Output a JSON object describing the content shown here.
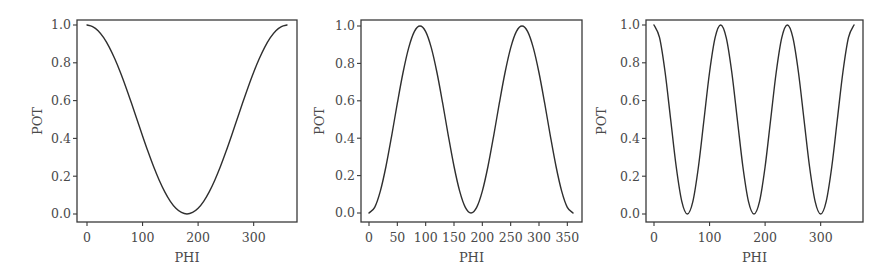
{
  "figure": {
    "panel_count": 3
  },
  "chart_data": [
    {
      "type": "line",
      "title": "",
      "xlabel": "PHI",
      "ylabel": "POT",
      "xlim": [
        0,
        360
      ],
      "ylim": [
        0.0,
        1.0
      ],
      "grid": false,
      "legend": null,
      "xticks": [
        0,
        100,
        200,
        300
      ],
      "xtick_labels": [
        "0",
        "100",
        "200",
        "300"
      ],
      "yticks": [
        0.0,
        0.2,
        0.4,
        0.6,
        0.8,
        1.0
      ],
      "ytick_labels": [
        "0.0",
        "0.2",
        "0.4",
        "0.6",
        "0.8",
        "1.0"
      ],
      "series": [
        {
          "name": "POT",
          "x": [
            0,
            10,
            20,
            30,
            40,
            50,
            60,
            70,
            80,
            90,
            100,
            110,
            120,
            130,
            140,
            150,
            160,
            170,
            180,
            190,
            200,
            210,
            220,
            230,
            240,
            250,
            260,
            270,
            280,
            290,
            300,
            310,
            320,
            330,
            340,
            350,
            360
          ],
          "y": [
            1.0,
            0.992,
            0.97,
            0.933,
            0.883,
            0.821,
            0.75,
            0.671,
            0.587,
            0.5,
            0.413,
            0.329,
            0.25,
            0.179,
            0.117,
            0.067,
            0.03,
            0.008,
            0.0,
            0.008,
            0.03,
            0.067,
            0.117,
            0.179,
            0.25,
            0.329,
            0.413,
            0.5,
            0.587,
            0.671,
            0.75,
            0.821,
            0.883,
            0.933,
            0.97,
            0.992,
            1.0
          ]
        }
      ]
    },
    {
      "type": "line",
      "title": "",
      "xlabel": "PHI",
      "ylabel": "POT",
      "xlim": [
        0,
        360
      ],
      "ylim": [
        0.0,
        1.0
      ],
      "grid": false,
      "legend": null,
      "xticks": [
        0,
        50,
        100,
        150,
        200,
        250,
        300,
        350
      ],
      "xtick_labels": [
        "0",
        "50",
        "100",
        "150",
        "200",
        "250",
        "300",
        "350"
      ],
      "yticks": [
        0.0,
        0.2,
        0.4,
        0.6,
        0.8,
        1.0
      ],
      "ytick_labels": [
        "0.0",
        "0.2",
        "0.4",
        "0.6",
        "0.8",
        "1.0"
      ],
      "series": [
        {
          "name": "POT",
          "x": [
            0,
            10,
            20,
            30,
            40,
            50,
            60,
            70,
            80,
            90,
            100,
            110,
            120,
            130,
            140,
            150,
            160,
            170,
            180,
            190,
            200,
            210,
            220,
            230,
            240,
            250,
            260,
            270,
            280,
            290,
            300,
            310,
            320,
            330,
            340,
            350,
            360
          ],
          "y": [
            0.0,
            0.03,
            0.117,
            0.25,
            0.413,
            0.587,
            0.75,
            0.883,
            0.97,
            1.0,
            0.97,
            0.883,
            0.75,
            0.587,
            0.413,
            0.25,
            0.117,
            0.03,
            0.0,
            0.03,
            0.117,
            0.25,
            0.413,
            0.587,
            0.75,
            0.883,
            0.97,
            1.0,
            0.97,
            0.883,
            0.75,
            0.587,
            0.413,
            0.25,
            0.117,
            0.03,
            0.0
          ]
        }
      ]
    },
    {
      "type": "line",
      "title": "",
      "xlabel": "PHI",
      "ylabel": "POT",
      "xlim": [
        0,
        360
      ],
      "ylim": [
        0.0,
        1.0
      ],
      "grid": false,
      "legend": null,
      "xticks": [
        0,
        100,
        200,
        300
      ],
      "xtick_labels": [
        "0",
        "100",
        "200",
        "300"
      ],
      "yticks": [
        0.0,
        0.2,
        0.4,
        0.6,
        0.8,
        1.0
      ],
      "ytick_labels": [
        "0.0",
        "0.2",
        "0.4",
        "0.6",
        "0.8",
        "1.0"
      ],
      "series": [
        {
          "name": "POT",
          "x": [
            0,
            10,
            20,
            30,
            40,
            50,
            60,
            70,
            80,
            90,
            100,
            110,
            120,
            130,
            140,
            150,
            160,
            170,
            180,
            190,
            200,
            210,
            220,
            230,
            240,
            250,
            260,
            270,
            280,
            290,
            300,
            310,
            320,
            330,
            340,
            350,
            360
          ],
          "y": [
            1.0,
            0.933,
            0.75,
            0.5,
            0.25,
            0.067,
            0.0,
            0.067,
            0.25,
            0.5,
            0.75,
            0.933,
            1.0,
            0.933,
            0.75,
            0.5,
            0.25,
            0.067,
            0.0,
            0.067,
            0.25,
            0.5,
            0.75,
            0.933,
            1.0,
            0.933,
            0.75,
            0.5,
            0.25,
            0.067,
            0.0,
            0.067,
            0.25,
            0.5,
            0.75,
            0.933,
            1.0
          ]
        }
      ]
    }
  ],
  "colors": {
    "line": "#2f2f2f",
    "axes": "#3a3a3a",
    "text": "#4a4a4a",
    "background": "#ffffff"
  }
}
